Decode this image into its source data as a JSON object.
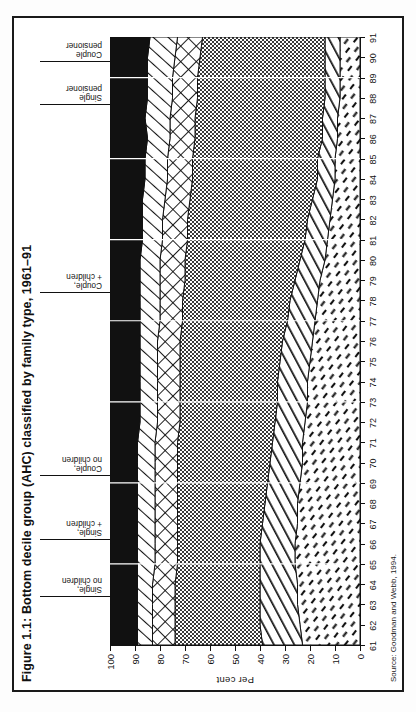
{
  "figure": {
    "number": "Figure 1.1:",
    "title": "Bottom decile group (AHC) classified by family type, 1961–91",
    "full_title": "Figure 1.1: Bottom decile group (AHC) classified by family type, 1961–91",
    "source": "Source: Goodman and Webb, 1994."
  },
  "axes": {
    "y_axis_label": "Per cent",
    "y_ticks": [
      "0",
      "10",
      "20",
      "30",
      "40",
      "50",
      "60",
      "70",
      "80",
      "90",
      "100"
    ],
    "x_ticks": [
      "61",
      "62",
      "63",
      "64",
      "65",
      "66",
      "67",
      "68",
      "69",
      "70",
      "71",
      "72",
      "73",
      "74",
      "75",
      "76",
      "77",
      "78",
      "79",
      "80",
      "81",
      "82",
      "83",
      "84",
      "85",
      "86",
      "87",
      "88",
      "89",
      "90",
      "91"
    ]
  },
  "legend": {
    "items": [
      {
        "key": "single_no_children",
        "label": "Single,\nno children",
        "pattern": "solid-black"
      },
      {
        "key": "single_children",
        "label": "Single,\n+ children",
        "pattern": "diagonal-lines"
      },
      {
        "key": "couple_no_children",
        "label": "Couple,\nno children",
        "pattern": "cross-hatch"
      },
      {
        "key": "couple_children",
        "label": "Couple,\n+ children",
        "pattern": "stipple-dots"
      },
      {
        "key": "single_pensioner",
        "label": "Single\npensioner",
        "pattern": "steep-diagonal"
      },
      {
        "key": "couple_pensioner",
        "label": "Couple\npensioner",
        "pattern": "short-dashes"
      }
    ]
  },
  "colors": {
    "solid_black": "#111111",
    "stipple": "#6f6f6f",
    "ink": "#111111",
    "paper": "#ffffff",
    "page": "#fdfdfd"
  },
  "chart_data": {
    "type": "area",
    "stacked": true,
    "normalized": true,
    "title": "Figure 1.1: Bottom decile group (AHC) classified by family type, 1961–91",
    "subtitle": "",
    "xlabel": "",
    "ylabel": "Per cent",
    "xlim": [
      1961,
      1991
    ],
    "ylim": [
      0,
      100
    ],
    "grid": false,
    "legend_position": "top-inline-callouts",
    "annotations": [
      "Source: Goodman and Webb, 1994."
    ],
    "x": [
      1961,
      1962,
      1963,
      1964,
      1965,
      1966,
      1967,
      1968,
      1969,
      1970,
      1971,
      1972,
      1973,
      1974,
      1975,
      1976,
      1977,
      1978,
      1979,
      1980,
      1981,
      1982,
      1983,
      1984,
      1985,
      1986,
      1987,
      1988,
      1989,
      1990,
      1991
    ],
    "x_tick_labels": [
      "61",
      "62",
      "63",
      "64",
      "65",
      "66",
      "67",
      "68",
      "69",
      "70",
      "71",
      "72",
      "73",
      "74",
      "75",
      "76",
      "77",
      "78",
      "79",
      "80",
      "81",
      "82",
      "83",
      "84",
      "85",
      "86",
      "87",
      "88",
      "89",
      "90",
      "91"
    ],
    "series": [
      {
        "name": "Couple pensioner",
        "pattern": "short-dashes",
        "values": [
          23,
          24,
          25,
          25,
          26,
          26,
          25,
          25,
          24,
          23,
          23,
          22,
          21,
          21,
          20,
          19,
          18,
          17,
          16,
          14,
          13,
          12,
          11,
          10,
          10,
          9,
          9,
          8,
          8,
          8,
          8
        ]
      },
      {
        "name": "Single pensioner",
        "pattern": "steep-diagonal",
        "values": [
          16,
          16,
          15,
          15,
          14,
          14,
          14,
          13,
          13,
          13,
          12,
          12,
          12,
          12,
          12,
          12,
          11,
          11,
          10,
          10,
          9,
          9,
          8,
          7,
          7,
          6,
          6,
          6,
          6,
          6,
          6
        ]
      },
      {
        "name": "Couple, + children",
        "pattern": "stipple-dots",
        "values": [
          35,
          34,
          34,
          34,
          33,
          33,
          34,
          35,
          36,
          37,
          38,
          38,
          39,
          39,
          40,
          41,
          42,
          43,
          44,
          46,
          47,
          48,
          49,
          50,
          50,
          51,
          51,
          51,
          51,
          50,
          49
        ]
      },
      {
        "name": "Couple, no children",
        "pattern": "cross-hatch",
        "values": [
          9,
          9,
          9,
          9,
          9,
          9,
          9,
          9,
          9,
          9,
          9,
          9,
          9,
          9,
          9,
          9,
          9,
          9,
          10,
          10,
          10,
          10,
          10,
          10,
          10,
          10,
          10,
          10,
          10,
          10,
          10
        ]
      },
      {
        "name": "Single, + children",
        "pattern": "diagonal-lines",
        "values": [
          6,
          6,
          6,
          6,
          7,
          7,
          7,
          7,
          7,
          7,
          7,
          7,
          7,
          7,
          7,
          7,
          8,
          8,
          8,
          8,
          8,
          8,
          9,
          9,
          9,
          9,
          10,
          10,
          10,
          11,
          11
        ]
      },
      {
        "name": "Single, no children",
        "pattern": "solid-black",
        "values": [
          11,
          11,
          11,
          11,
          11,
          11,
          11,
          11,
          11,
          11,
          11,
          12,
          12,
          12,
          12,
          12,
          12,
          12,
          12,
          12,
          13,
          13,
          13,
          14,
          14,
          15,
          14,
          15,
          15,
          15,
          16
        ]
      }
    ]
  }
}
